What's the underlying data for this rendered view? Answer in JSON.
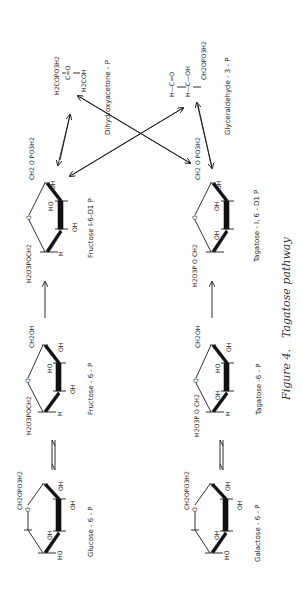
{
  "figure": {
    "caption_number": "Figure 4.",
    "caption_title": "Tagatose pathway",
    "orientation": "rotated 90° (landscape on portrait page)"
  },
  "molecules": {
    "dhap": {
      "name": "Dihydroxyacetone - P",
      "line1": "H2COPO3H2",
      "line2": "C=O",
      "line3": "H2COH"
    },
    "g3p": {
      "name": "Glyceraldehyde - 3 - P",
      "line1": "H—C=O",
      "line2": "H—C—OH",
      "line3": "CH2OPO3H2"
    },
    "fructose_16": {
      "name": "Fructose I-6-D1 P",
      "left_group": "H2O3POCH2",
      "right_group": "CH2 O PO3H2",
      "sub_top": "HO",
      "sub_mid": "OH",
      "sub_bottom": "H",
      "sub_right": "OH",
      "ring_o": "O"
    },
    "tagatose_16": {
      "name": "Tagatose - I, 6 - D1 P",
      "left_group": "H2O3P O CH2",
      "right_group": "CH2 O PO3H2",
      "sub_top": "OH",
      "sub_mid": "OH",
      "sub_right": "OH",
      "ring_o": "O"
    },
    "fructose_6p": {
      "name": "Fructose - 6 - P",
      "left_group": "H2O3POCH2",
      "right_group": "CH2OH",
      "sub_top": "HO",
      "sub_mid": "OH",
      "sub_bottom": "H",
      "sub_right": "OH",
      "ring_o": "O"
    },
    "tagatose_6p": {
      "name": "Tagatose -6 - P",
      "left_group": "H2O3P O CH2",
      "right_group": "CH2OH",
      "sub_top": "HO",
      "sub_mid": "OH",
      "sub_bottom": "H",
      "sub_right": "OH",
      "ring_o": "O"
    },
    "glucose_6p": {
      "name": "Glucose - 6 - P",
      "top_group": "CH2OPO3H2",
      "sub_1": "HO",
      "sub_2": "OH",
      "sub_3": "OH",
      "sub_4": "OH",
      "ring_o": "O"
    },
    "galactose_6p": {
      "name": "Galactose - 6 - P",
      "top_group": "CH2OPO3H2",
      "sub_1": "HO",
      "sub_2": "OH",
      "sub_3": "OH",
      "sub_4": "OH",
      "ring_o": "O"
    }
  },
  "reactions": [
    {
      "from": "glucose_6p",
      "to": "fructose_6p",
      "type": "reversible"
    },
    {
      "from": "fructose_6p",
      "to": "fructose_16",
      "type": "forward"
    },
    {
      "from": "galactose_6p",
      "to": "tagatose_6p",
      "type": "reversible"
    },
    {
      "from": "tagatose_6p",
      "to": "tagatose_16",
      "type": "forward"
    },
    {
      "from": "fructose_16",
      "to": "dhap",
      "type": "reversible"
    },
    {
      "from": "fructose_16",
      "to": "g3p",
      "type": "reversible"
    },
    {
      "from": "tagatose_16",
      "to": "dhap",
      "type": "reversible"
    },
    {
      "from": "tagatose_16",
      "to": "g3p",
      "type": "reversible"
    }
  ]
}
